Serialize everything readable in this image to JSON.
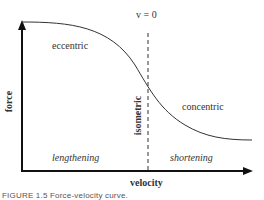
{
  "figure": {
    "caption": "FIGURE 1.5  Force-velocity curve.",
    "vertical_marker_label": "v = 0",
    "y_axis_label": "force",
    "x_axis_label": "velocity",
    "regions": {
      "eccentric": "eccentric",
      "concentric": "concentric",
      "isometric": "isometric",
      "lengthening": "lengthening",
      "shortening": "shortening"
    },
    "colors": {
      "axis": "#111111",
      "curve": "#333333",
      "text": "#333333",
      "dashed": "#333333"
    }
  }
}
